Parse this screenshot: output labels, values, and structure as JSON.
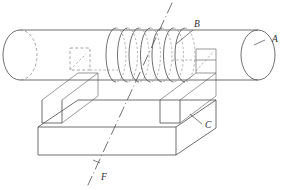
{
  "figure": {
    "type": "engineering-line-drawing",
    "background_color": "#ffffff",
    "line_color": "#4a4a4a",
    "hidden_line_color": "#808080",
    "label_color": "#2e2e2e",
    "width": 290,
    "height": 190
  },
  "labels": {
    "a": "A",
    "b": "B",
    "c": "C",
    "f": "F"
  },
  "parts": {
    "cylinder": {
      "name": "A",
      "description": "horizontal cylindrical shaft",
      "left_end_x": 20,
      "right_end_x": 258,
      "top_y": 30,
      "bottom_y": 80,
      "ellipse_rx": 17,
      "ellipse_ry": 25
    },
    "coil": {
      "name": "B",
      "description": "helical coil wound around shaft",
      "turn_count": 7,
      "first_turn_cx": 116,
      "turn_pitch": 11.5,
      "turn_rx": 10,
      "turn_ry": 27
    },
    "base_plate": {
      "name": "C",
      "description": "rectangular base plate supporting the blocks"
    },
    "support_blocks": {
      "count": 2,
      "description": "two rectangular support blocks between shaft and base plate"
    },
    "axis_line": {
      "name": "F",
      "description": "dash-dot reference axis running diagonally through the assembly",
      "style": "dash-dot"
    }
  },
  "annotations": [
    {
      "label": "A",
      "target": "cylinder right end face",
      "x": 272,
      "y": 42
    },
    {
      "label": "B",
      "target": "coil",
      "x": 196,
      "y": 27
    },
    {
      "label": "C",
      "target": "base plate right edge",
      "x": 205,
      "y": 127
    },
    {
      "label": "F",
      "target": "axis line",
      "x": 101,
      "y": 179
    }
  ]
}
